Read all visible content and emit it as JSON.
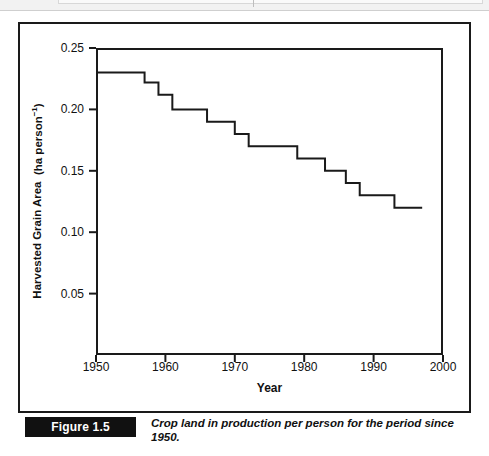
{
  "figure": {
    "tag": "Figure 1.5",
    "caption": "Crop land in production per person for the period since 1950."
  },
  "chart_data": {
    "type": "line",
    "line_style": "step-post",
    "title": "",
    "xlabel": "Year",
    "ylabel": "Harvested Grain Area  (ha person⁻¹)",
    "ylabel_main": "Harvested Grain Area",
    "ylabel_unit": "(ha person",
    "ylabel_unit_sup": "−1",
    "ylabel_unit_close": ")",
    "xlim": [
      1950,
      2000
    ],
    "ylim": [
      0.0,
      0.25
    ],
    "xticks": [
      1950,
      1960,
      1970,
      1980,
      1990,
      2000
    ],
    "xtick_labels": [
      "1950",
      "1960",
      "1970",
      "1980",
      "1990",
      "2000"
    ],
    "yticks": [
      0.05,
      0.1,
      0.15,
      0.2,
      0.25
    ],
    "ytick_labels": [
      "0.05",
      "0.10",
      "0.15",
      "0.20",
      "0.25"
    ],
    "grid": false,
    "legend": false,
    "line_color": "#1a1a1a",
    "line_width": 2,
    "series": [
      {
        "name": "Harvested grain area per person",
        "x": [
          1950,
          1956,
          1957,
          1958,
          1959,
          1960,
          1961,
          1962,
          1965,
          1966,
          1969,
          1970,
          1972,
          1978,
          1979,
          1982,
          1983,
          1985,
          1986,
          1987,
          1988,
          1992,
          1993,
          1997
        ],
        "values": [
          0.23,
          0.23,
          0.222,
          0.222,
          0.212,
          0.212,
          0.2,
          0.2,
          0.2,
          0.19,
          0.19,
          0.18,
          0.17,
          0.17,
          0.16,
          0.16,
          0.15,
          0.15,
          0.14,
          0.14,
          0.13,
          0.13,
          0.12,
          0.12
        ]
      }
    ]
  },
  "colors": {
    "axis": "#1a1a1a",
    "frame": "#1a1a1a",
    "background": "#ffffff",
    "tag_background": "#111111",
    "tag_text": "#ffffff"
  }
}
